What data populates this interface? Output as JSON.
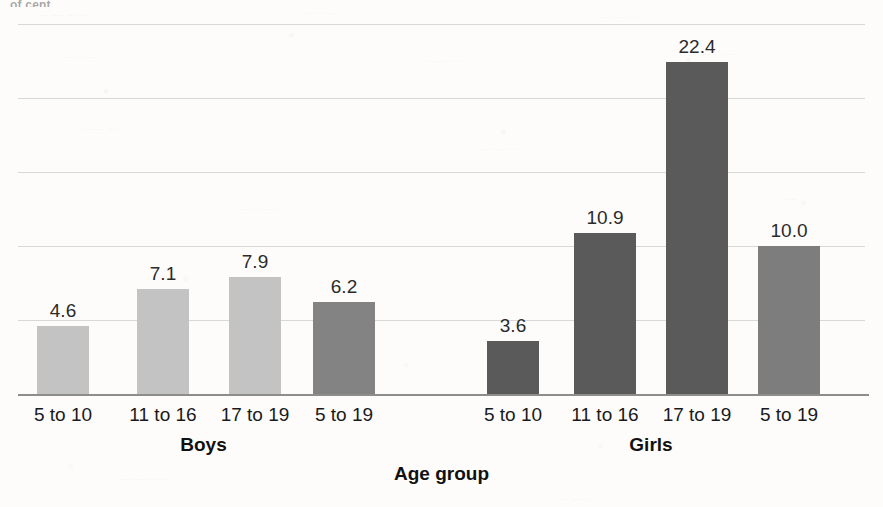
{
  "chart_data": {
    "type": "bar",
    "title": "",
    "xlabel": "Age group",
    "ylabel": "",
    "ylim": [
      0,
      25
    ],
    "grid": true,
    "gridline_values": [
      0,
      5,
      10,
      15,
      20,
      25
    ],
    "show_y_ticklabels": false,
    "legend": "none",
    "groups": [
      "Boys",
      "Girls"
    ],
    "categories": [
      "5 to 10",
      "11 to 16",
      "17 to 19",
      "5 to 19"
    ],
    "series": [
      {
        "name": "Boys",
        "values": [
          4.6,
          7.1,
          7.9,
          6.2
        ]
      },
      {
        "name": "Girls",
        "values": [
          3.6,
          10.9,
          22.4,
          10.0
        ]
      }
    ],
    "bars": [
      {
        "group": "Boys",
        "category": "5 to 10",
        "value": 4.6,
        "label": "4.6",
        "color": "#c3c3c3"
      },
      {
        "group": "Boys",
        "category": "11 to 16",
        "value": 7.1,
        "label": "7.1",
        "color": "#c3c3c3"
      },
      {
        "group": "Boys",
        "category": "17 to 19",
        "value": 7.9,
        "label": "7.9",
        "color": "#c3c3c3"
      },
      {
        "group": "Boys",
        "category": "5 to 19",
        "value": 6.2,
        "label": "6.2",
        "color": "#838383"
      },
      {
        "group": "Girls",
        "category": "5 to 10",
        "value": 3.6,
        "label": "3.6",
        "color": "#5a5a5a"
      },
      {
        "group": "Girls",
        "category": "11 to 16",
        "value": 10.9,
        "label": "10.9",
        "color": "#5a5a5a"
      },
      {
        "group": "Girls",
        "category": "17 to 19",
        "value": 22.4,
        "label": "22.4",
        "color": "#5a5a5a"
      },
      {
        "group": "Girls",
        "category": "5 to 19",
        "value": 10.0,
        "label": "10.0",
        "color": "#7d7d7d"
      }
    ],
    "colors": {
      "bar_light": "#c3c3c3",
      "bar_medium": "#838383",
      "bar_dark": "#5a5a5a",
      "gridline": "#d8d8d6",
      "axis": "#8d8d8b",
      "text": "#1a1a1a",
      "background": "#fdfcfa"
    }
  },
  "axis": {
    "x_title": "Age group"
  },
  "group_labels": [
    {
      "name": "Boys"
    },
    {
      "name": "Girls"
    }
  ],
  "category_labels": [
    {
      "text": "5 to 10"
    },
    {
      "text": "11 to 16"
    },
    {
      "text": "17 to 19"
    },
    {
      "text": "5 to 19"
    },
    {
      "text": "5 to 10"
    },
    {
      "text": "11 to 16"
    },
    {
      "text": "17 to 19"
    },
    {
      "text": "5 to 19"
    }
  ],
  "bar_value_labels": [
    {
      "text": "4.6"
    },
    {
      "text": "7.1"
    },
    {
      "text": "7.9"
    },
    {
      "text": "6.2"
    },
    {
      "text": "3.6"
    },
    {
      "text": "10.9"
    },
    {
      "text": "22.4"
    },
    {
      "text": "10.0"
    }
  ],
  "artifacts": {
    "top_clipped_text": "of cent"
  }
}
